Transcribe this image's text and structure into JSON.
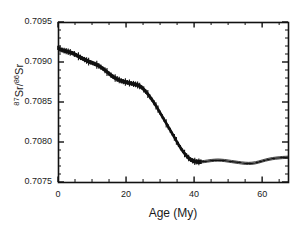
{
  "chart_data": {
    "type": "line",
    "title": "",
    "subtitle": "",
    "xlabel": "Age (My)",
    "ylabel_html": "<sup>87</sup>Sr/<sup>86</sup>Sr",
    "ylabel_plain": "87Sr/86Sr",
    "xlim": [
      0,
      67.6
    ],
    "ylim": [
      0.7075,
      0.7095
    ],
    "xticks": [
      0,
      20,
      40,
      60
    ],
    "xtick_labels": [
      "0",
      "20",
      "40",
      "60"
    ],
    "x_minor_tick_interval": 5,
    "yticks": [
      0.7075,
      0.708,
      0.7085,
      0.709,
      0.7095
    ],
    "ytick_labels": [
      "0.7075",
      "0.7080",
      "0.7085",
      "0.7090",
      "0.7095"
    ],
    "y_minor_tick_interval": 0.0001,
    "grid": false,
    "legend": null,
    "series": [
      {
        "name": "Seawater 87Sr/86Sr (LOWESS fit with error envelope)",
        "color": "#111111",
        "x": [
          0.0,
          0.6,
          1.2,
          1.8,
          2.4,
          3.0,
          3.6,
          4.2,
          4.8,
          5.4,
          6.0,
          6.6,
          7.2,
          7.8,
          8.4,
          9.0,
          9.6,
          10.2,
          10.8,
          11.4,
          12.0,
          12.6,
          13.2,
          13.8,
          14.4,
          15.0,
          15.6,
          16.2,
          16.8,
          17.4,
          18.0,
          18.6,
          19.2,
          19.8,
          20.4,
          21.0,
          21.6,
          22.2,
          22.8,
          23.4,
          24.0,
          24.6,
          25.2,
          25.8,
          26.4,
          27.0,
          27.6,
          28.2,
          28.8,
          29.4,
          30.0,
          30.6,
          31.2,
          31.8,
          32.4,
          33.0,
          33.6,
          34.2,
          34.8,
          35.4,
          36.0,
          36.6,
          37.2,
          37.8,
          38.4,
          39.0,
          39.6,
          40.2,
          40.8,
          41.4,
          42.0,
          43.0,
          44.0,
          45.0,
          46.0,
          47.0,
          48.0,
          49.0,
          50.0,
          51.0,
          52.0,
          53.0,
          54.0,
          55.0,
          56.0,
          57.0,
          58.0,
          59.0,
          60.0,
          61.0,
          62.0,
          63.0,
          64.0,
          65.0,
          66.0,
          67.0,
          67.6
        ],
        "y": [
          0.709175,
          0.70916,
          0.70915,
          0.709142,
          0.709135,
          0.709128,
          0.70912,
          0.709112,
          0.7091,
          0.709086,
          0.709072,
          0.709058,
          0.709044,
          0.70903,
          0.709018,
          0.709006,
          0.708996,
          0.708986,
          0.708976,
          0.708966,
          0.708952,
          0.708936,
          0.708918,
          0.708898,
          0.708876,
          0.708854,
          0.708834,
          0.708816,
          0.7088,
          0.708786,
          0.708774,
          0.708764,
          0.708756,
          0.70875,
          0.708744,
          0.708738,
          0.708732,
          0.708726,
          0.70872,
          0.708712,
          0.7087,
          0.708682,
          0.708658,
          0.70863,
          0.7086,
          0.708566,
          0.70853,
          0.708492,
          0.708452,
          0.70841,
          0.708366,
          0.708322,
          0.708278,
          0.708234,
          0.70819,
          0.708146,
          0.708102,
          0.708058,
          0.708014,
          0.70797,
          0.707928,
          0.70789,
          0.707856,
          0.707826,
          0.7078,
          0.70778,
          0.707766,
          0.707758,
          0.707754,
          0.707752,
          0.707752,
          0.707756,
          0.707762,
          0.707768,
          0.707772,
          0.707774,
          0.707772,
          0.707768,
          0.707762,
          0.707756,
          0.70775,
          0.707744,
          0.707738,
          0.707734,
          0.707732,
          0.707734,
          0.70774,
          0.70775,
          0.707762,
          0.707774,
          0.707784,
          0.707792,
          0.707798,
          0.707802,
          0.707806,
          0.707808,
          0.70781
        ],
        "error_band_half_width": 1.8e-05,
        "band_visible_range": [
          0,
          42
        ],
        "envelope_style": "thin double line after 42 My"
      }
    ],
    "axis_color": "#111111",
    "background_color": "#ffffff"
  },
  "figure": {
    "frame": {
      "left_px": 58,
      "top_px": 22,
      "right_px": 288,
      "bottom_px": 182
    }
  }
}
